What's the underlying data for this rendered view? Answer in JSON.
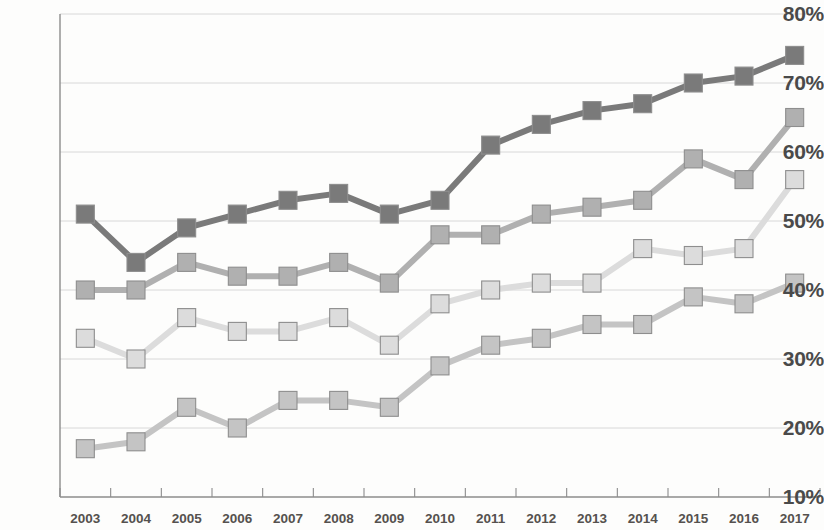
{
  "chart_data": {
    "type": "line",
    "title": "",
    "subtitle": "",
    "xlabel": "",
    "ylabel": "",
    "grid": true,
    "legend_position": "none",
    "x": [
      2003,
      2004,
      2005,
      2006,
      2007,
      2008,
      2009,
      2010,
      2011,
      2012,
      2013,
      2014,
      2015,
      2016,
      2017
    ],
    "categories": [
      "2003",
      "2004",
      "2005",
      "2006",
      "2007",
      "2008",
      "2009",
      "2010",
      "2011",
      "2012",
      "2013",
      "2014",
      "2015",
      "2016",
      "2017"
    ],
    "xlim": [
      2002.5,
      2017.5
    ],
    "ylim": [
      10,
      80
    ],
    "ytick_labels": [
      "80%",
      "70%",
      "60%",
      "50%",
      "40%",
      "30%",
      "20%",
      "10%"
    ],
    "ytick_values": [
      80,
      70,
      60,
      50,
      40,
      30,
      20,
      10
    ],
    "yunit": "%",
    "series": [
      {
        "name": "series-1-dark",
        "color": "#7a7a7a",
        "marker": "square",
        "values": [
          51,
          44,
          49,
          51,
          53,
          54,
          51,
          53,
          61,
          64,
          66,
          67,
          70,
          71,
          74
        ]
      },
      {
        "name": "series-2-medium",
        "color": "#b0b0b0",
        "marker": "square",
        "values": [
          40,
          40,
          44,
          42,
          42,
          44,
          41,
          48,
          48,
          51,
          52,
          53,
          59,
          56,
          65
        ]
      },
      {
        "name": "series-3-light",
        "color": "#dcdcdc",
        "marker": "square",
        "values": [
          33,
          30,
          36,
          34,
          34,
          36,
          32,
          38,
          40,
          41,
          41,
          46,
          45,
          46,
          56
        ]
      },
      {
        "name": "series-4-bottom",
        "color": "#c4c4c4",
        "marker": "square",
        "values": [
          17,
          18,
          23,
          20,
          24,
          24,
          23,
          29,
          32,
          33,
          35,
          35,
          39,
          38,
          41
        ]
      }
    ]
  },
  "axes": {
    "line_color": "#8c8c8c",
    "grid_color": "#d8d8d8",
    "label_color": "#4a4a4a"
  }
}
